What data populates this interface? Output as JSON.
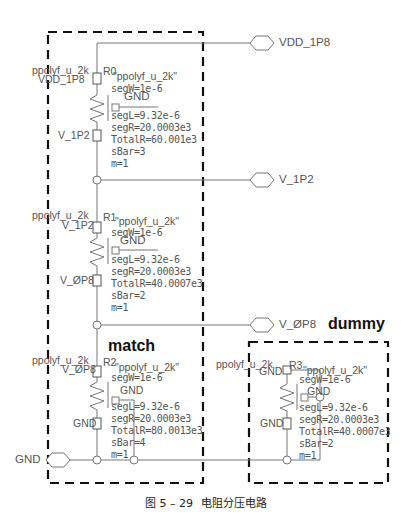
{
  "caption": {
    "figure": "图 5 – 29",
    "title": "电阻分压电路"
  },
  "groups": {
    "match": "match",
    "dummy": "dummy"
  },
  "pins": {
    "vdd": "VDD_1P8",
    "v1p2": "V_1P2",
    "v0p8": "V_ØP8",
    "gnd": "GND"
  },
  "resistors": [
    {
      "inst": "R0",
      "cell": "ppolyf_u_2k",
      "model": "\"ppolyf_u_2k\"",
      "top_net": "VDD_1P8",
      "bot_net": "V_1P2",
      "body_net": "GND",
      "params": [
        "segW=1e-6",
        "segL=9.32e-6",
        "segR=20.0003e3",
        "TotalR=60.001e3",
        "sBar=3",
        "m=1"
      ]
    },
    {
      "inst": "R1",
      "cell": "ppolyf_u_2k",
      "model": "\"ppolyf_u_2k\"",
      "top_net": "V_1P2",
      "bot_net": "V_ØP8",
      "body_net": "GND",
      "params": [
        "segW=1e-6",
        "segL=9.32e-6",
        "segR=20.0003e3",
        "TotalR=40.0007e3",
        "sBar=2",
        "m=1"
      ]
    },
    {
      "inst": "R2",
      "cell": "ppolyf_u_2k",
      "model": "\"ppolyf_u_2k\"",
      "top_net": "V_ØP8",
      "bot_net": "GND",
      "body_net": "GND",
      "params": [
        "segW=1e-6",
        "segL=9.32e-6",
        "segR=20.0003e3",
        "TotalR=80.0013e3",
        "sBar=4",
        "m=1"
      ]
    },
    {
      "inst": "R3",
      "cell": "ppolyf_u_2k",
      "model": "\"ppolyf_u_2k\"",
      "top_net": "GND",
      "bot_net": "GND",
      "body_net": "GND",
      "params": [
        "segW=1e-6",
        "segL=9.32e-6",
        "segR=20.0003e3",
        "TotalR=40.0007e3",
        "sBar=2",
        "m=1"
      ]
    }
  ],
  "colors": {
    "wire": "#777777",
    "box": "#111111",
    "text": "#555555"
  }
}
